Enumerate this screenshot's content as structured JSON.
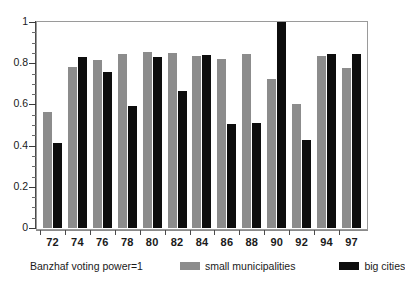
{
  "chart_data": {
    "type": "bar",
    "title": "",
    "xlabel": "",
    "ylabel": "",
    "ylim": [
      0,
      1
    ],
    "grid": false,
    "legend_position": "bottom",
    "caption": "Banzhaf voting power=1",
    "categories": [
      "72",
      "74",
      "76",
      "78",
      "80",
      "82",
      "84",
      "86",
      "88",
      "90",
      "92",
      "94",
      "97"
    ],
    "ytick_labels": [
      "1",
      "0.8",
      "0.6",
      "0.4",
      "0.2",
      "0"
    ],
    "ytick_values": [
      1,
      0.8,
      0.6,
      0.4,
      0.2,
      0
    ],
    "series": [
      {
        "name": "small municipalities",
        "color": "#8c8c8c",
        "values": [
          0.565,
          0.78,
          0.815,
          0.845,
          0.855,
          0.85,
          0.835,
          0.82,
          0.845,
          0.725,
          0.6,
          0.835,
          0.775
        ]
      },
      {
        "name": "big cities",
        "color": "#0d0d0d",
        "values": [
          0.415,
          0.83,
          0.755,
          0.59,
          0.83,
          0.665,
          0.84,
          0.505,
          0.51,
          1.0,
          0.425,
          0.845,
          0.845
        ]
      }
    ]
  }
}
